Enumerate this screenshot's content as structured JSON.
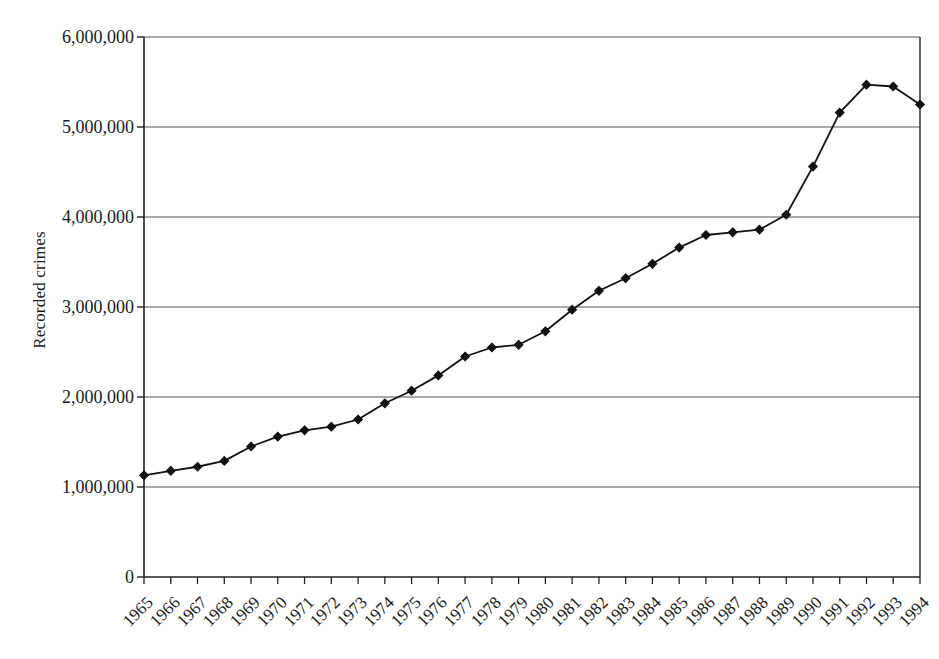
{
  "chart_data": {
    "type": "line",
    "title": "",
    "subtitle": "",
    "xlabel": "",
    "ylabel": "Recorded crimes",
    "legend": [],
    "legend_position": "none",
    "grid": true,
    "grid_axis": "y",
    "xlim": [
      "1965",
      "1994"
    ],
    "ylim": [
      0,
      6000000
    ],
    "y_ticks": [
      0,
      1000000,
      2000000,
      3000000,
      4000000,
      5000000,
      6000000
    ],
    "y_tick_labels": [
      "0",
      "1,000,000",
      "2,000,000",
      "3,000,000",
      "4,000,000",
      "5,000,000",
      "6,000,000"
    ],
    "categories": [
      "1965",
      "1966",
      "1967",
      "1968",
      "1969",
      "1970",
      "1971",
      "1972",
      "1973",
      "1974",
      "1975",
      "1976",
      "1977",
      "1978",
      "1979",
      "1980",
      "1981",
      "1982",
      "1983",
      "1984",
      "1985",
      "1986",
      "1987",
      "1988",
      "1989",
      "1990",
      "1991",
      "1992",
      "1993",
      "1994"
    ],
    "values": [
      1130000,
      1180000,
      1225000,
      1290000,
      1450000,
      1560000,
      1630000,
      1670000,
      1750000,
      1930000,
      2070000,
      2240000,
      2450000,
      2550000,
      2580000,
      2730000,
      2970000,
      3180000,
      3320000,
      3480000,
      3660000,
      3800000,
      3830000,
      3860000,
      4025000,
      4560000,
      5160000,
      5470000,
      5450000,
      5250000
    ],
    "series_name": "Recorded crimes",
    "marker": "diamond",
    "marker_color": "#111111",
    "line_color": "#111111",
    "grid_color": "#555555",
    "axis_color": "#222222",
    "background": "#ffffff"
  },
  "axes": {
    "y_title": "Recorded crimes"
  }
}
